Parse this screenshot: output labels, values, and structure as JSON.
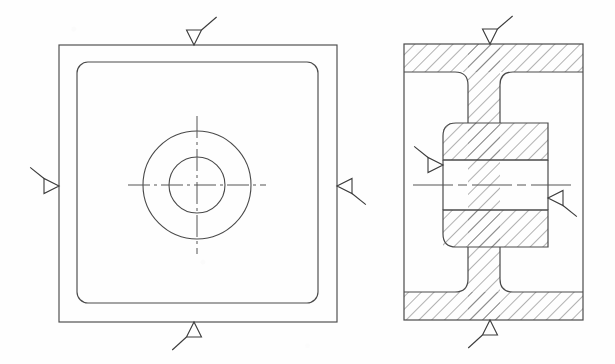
{
  "sheet": {
    "title": "Mechanical Part Drawing - Two Views",
    "width": 615,
    "height": 364,
    "background_color": "#fefefe",
    "line_color": "#4a4a4a",
    "line_color_dark": "#3a3a3a",
    "hatch_color": "#555555",
    "centerline_color": "#555555"
  },
  "views": [
    {
      "id": "front-view",
      "name": "front-view",
      "type": "orthographic-front",
      "description": "Square plate front view with concentric circles and centerlines",
      "outer_square": {
        "x": 59,
        "y": 45,
        "width": 278,
        "height": 277,
        "corner_radius": 0
      },
      "inner_rounded_square": {
        "x": 77,
        "y": 62,
        "width": 241,
        "height": 241,
        "corner_radius": 11
      },
      "center": {
        "cx": 197,
        "cy": 185
      },
      "circles": [
        {
          "name": "outer-circle",
          "r": 54
        },
        {
          "name": "inner-circle",
          "r": 28
        }
      ],
      "centerlines": {
        "horizontal_extent": 69,
        "vertical_extent": 69
      }
    },
    {
      "id": "section-view",
      "name": "section-view",
      "type": "full-section",
      "description": "Cross-section view with 45 degree hatching showing flanged hub with through bore",
      "outer_rect": {
        "x": 404,
        "y": 44,
        "width": 179,
        "height": 276
      },
      "bore": {
        "x": 443,
        "y": 160,
        "width": 105,
        "height": 50
      },
      "hub": {
        "x": 443,
        "y": 123,
        "width": 105,
        "height": 124
      },
      "web": {
        "x": 468,
        "y": 44,
        "width": 32,
        "height": 276
      },
      "flange_top": {
        "x": 404,
        "y": 44,
        "width": 179,
        "height": 28
      },
      "flange_bottom": {
        "x": 404,
        "y": 292,
        "width": 179,
        "height": 28
      },
      "fillet_radius": 13,
      "hatch": {
        "angle_deg": 45,
        "spacing_px": 9,
        "line_width": 0.9
      }
    }
  ],
  "surface_finish_symbols": [
    {
      "id": "sfs-front-top",
      "name": "surface-finish-symbol-front-top",
      "view": "front-view",
      "position": "top",
      "direction": "down",
      "apex": {
        "x": 194,
        "y": 45
      },
      "size": 15,
      "tail_length": 21,
      "label": "surface-finish-symbol"
    },
    {
      "id": "sfs-front-left",
      "name": "surface-finish-symbol-front-left",
      "view": "front-view",
      "position": "left",
      "direction": "right",
      "apex": {
        "x": 59,
        "y": 186
      },
      "size": 15,
      "tail_length": 21,
      "label": "surface-finish-symbol"
    },
    {
      "id": "sfs-front-right",
      "name": "surface-finish-symbol-front-right",
      "view": "front-view",
      "position": "right",
      "direction": "left",
      "apex": {
        "x": 337,
        "y": 186
      },
      "size": 15,
      "tail_length": 21,
      "label": "surface-finish-symbol"
    },
    {
      "id": "sfs-front-bottom",
      "name": "surface-finish-symbol-front-bottom",
      "view": "front-view",
      "position": "bottom",
      "direction": "up",
      "apex": {
        "x": 194,
        "y": 322
      },
      "size": 15,
      "tail_length": 21,
      "label": "surface-finish-symbol"
    },
    {
      "id": "sfs-section-top",
      "name": "surface-finish-symbol-section-top",
      "view": "section-view",
      "position": "top",
      "direction": "down",
      "apex": {
        "x": 490,
        "y": 44
      },
      "size": 15,
      "tail_length": 21,
      "label": "surface-finish-symbol"
    },
    {
      "id": "sfs-section-left",
      "name": "surface-finish-symbol-section-left",
      "view": "section-view",
      "position": "left",
      "direction": "right",
      "apex": {
        "x": 443,
        "y": 165
      },
      "size": 15,
      "tail_length": 21,
      "label": "surface-finish-symbol"
    },
    {
      "id": "sfs-section-right",
      "name": "surface-finish-symbol-section-right",
      "view": "section-view",
      "position": "right",
      "direction": "left",
      "apex": {
        "x": 548,
        "y": 198
      },
      "size": 15,
      "tail_length": 21,
      "label": "surface-finish-symbol"
    },
    {
      "id": "sfs-section-bottom",
      "name": "surface-finish-symbol-section-bottom",
      "view": "section-view",
      "position": "bottom",
      "direction": "up",
      "apex": {
        "x": 490,
        "y": 320
      },
      "size": 15,
      "tail_length": 21,
      "label": "surface-finish-symbol"
    }
  ],
  "annotations": {
    "has_dimensions": false,
    "has_text_labels": false,
    "has_title_block": false,
    "symbol_count": 8
  }
}
